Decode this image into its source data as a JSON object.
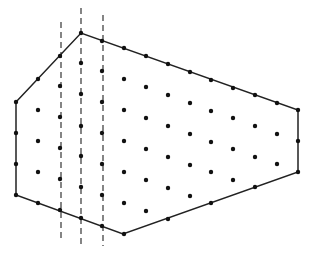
{
  "diagram": {
    "colors": {
      "stroke": "#222222",
      "point": "#111111",
      "background": "#ffffff"
    },
    "polygon": [
      [
        16,
        102
      ],
      [
        81,
        33
      ],
      [
        298,
        110
      ],
      [
        298,
        172
      ],
      [
        123,
        234
      ],
      [
        16,
        195
      ]
    ],
    "dashed_lines": [
      {
        "x": 61,
        "y1": 22,
        "y2": 238
      },
      {
        "x": 81,
        "y1": 8,
        "y2": 246
      },
      {
        "x": 103,
        "y1": 15,
        "y2": 246
      }
    ],
    "lattice_columns": [
      {
        "x": 16,
        "ys": [
          102,
          133,
          164,
          195
        ]
      },
      {
        "x": 38,
        "ys": [
          79,
          110,
          141,
          172,
          203
        ]
      },
      {
        "x": 60,
        "ys": [
          56,
          86,
          117,
          148,
          179,
          210
        ]
      },
      {
        "x": 81,
        "ys": [
          33,
          63,
          94,
          126,
          156,
          187,
          218
        ]
      },
      {
        "x": 102,
        "ys": [
          41,
          71,
          102,
          133,
          164,
          195,
          226
        ]
      },
      {
        "x": 124,
        "ys": [
          48,
          79,
          110,
          141,
          172,
          203,
          234
        ]
      },
      {
        "x": 146,
        "ys": [
          56,
          87,
          118,
          149,
          180,
          211
        ]
      },
      {
        "x": 168,
        "ys": [
          64,
          95,
          126,
          157,
          188,
          219
        ]
      },
      {
        "x": 190,
        "ys": [
          72,
          103,
          134,
          165,
          196
        ]
      },
      {
        "x": 211,
        "ys": [
          80,
          111,
          142,
          172,
          203
        ]
      },
      {
        "x": 233,
        "ys": [
          88,
          118,
          149,
          180
        ]
      },
      {
        "x": 255,
        "ys": [
          95,
          126,
          157,
          187
        ]
      },
      {
        "x": 277,
        "ys": [
          103,
          134,
          164
        ]
      },
      {
        "x": 298,
        "ys": [
          110,
          141,
          172
        ]
      }
    ]
  }
}
